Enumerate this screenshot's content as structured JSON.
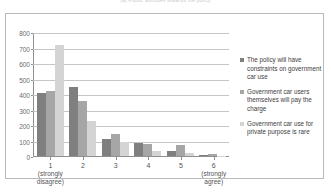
{
  "chart_data": {
    "type": "bar",
    "title": "",
    "xlabel": "",
    "ylabel": "",
    "ylim": [
      0,
      800
    ],
    "ytick_step": 100,
    "grid": true,
    "legend_position": "right",
    "categories": [
      "1",
      "2",
      "3",
      "4",
      "5",
      "6"
    ],
    "category_sublabels": [
      [
        "(strongly",
        "disagree)"
      ],
      [
        "",
        ""
      ],
      [
        "",
        ""
      ],
      [
        "",
        ""
      ],
      [
        "",
        ""
      ],
      [
        "(strongly",
        "agree)"
      ]
    ],
    "ytick_labels": [
      "800",
      "700",
      "600",
      "500",
      "400",
      "300",
      "200",
      "100",
      "0"
    ],
    "series": [
      {
        "name": "The policy will have constraints on government car use",
        "color": "#7f7f7f",
        "values": [
          408,
          448,
          112,
          82,
          35,
          8
        ]
      },
      {
        "name": "Government car users themselves will pay the charge",
        "color": "#a6a6a6",
        "values": [
          420,
          358,
          140,
          78,
          70,
          15
        ]
      },
      {
        "name": "Government car use for private purpose is rare",
        "color": "#d4d4d4",
        "values": [
          725,
          230,
          88,
          30,
          22,
          3
        ]
      }
    ]
  },
  "legend": {
    "items": [
      {
        "label": "The policy will have constraints on government car use",
        "color": "#7f7f7f"
      },
      {
        "label": "Government car users themselves will pay the charge",
        "color": "#a6a6a6"
      },
      {
        "label": "Government car use for private purpose is rare",
        "color": "#d4d4d4"
      }
    ]
  },
  "figure": {
    "clipped_title": "(a) Public attitudes towards the policy"
  }
}
